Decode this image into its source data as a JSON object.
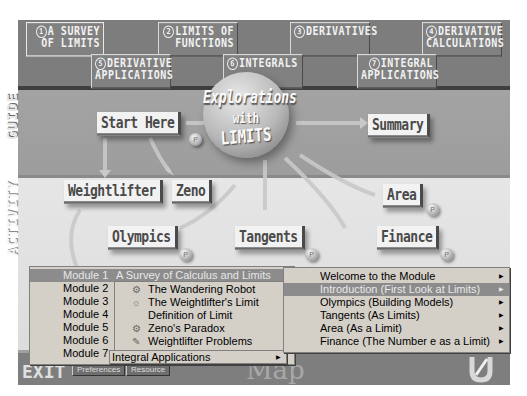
{
  "app_title": "Explorations with Limits",
  "module_tabs": [
    {
      "num": "1",
      "line1": "A SURVEY",
      "line2": "OF LIMITS",
      "active": true
    },
    {
      "num": "2",
      "line1": "LIMITS OF",
      "line2": "FUNCTIONS",
      "active": false
    },
    {
      "num": "3",
      "line1": "DERIVATIVES",
      "line2": "",
      "active": false
    },
    {
      "num": "4",
      "line1": "DERIVATIVE",
      "line2": "CALCULATIONS",
      "active": false
    },
    {
      "num": "5",
      "line1": "DERIVATIVE",
      "line2": "APPLICATIONS",
      "active": false
    },
    {
      "num": "6",
      "line1": "INTEGRALS",
      "line2": "",
      "active": false
    },
    {
      "num": "7",
      "line1": "INTEGRAL",
      "line2": "APPLICATIONS",
      "active": false
    }
  ],
  "sections": {
    "guide": "GUIDE",
    "activity": "ACTIVITY"
  },
  "center_sphere": {
    "line1": "Explorations",
    "line2": "with",
    "line3": "LIMITS"
  },
  "guide_nodes": {
    "start": "Start Here",
    "summary": "Summary"
  },
  "activity_nodes": {
    "weightlifter": "Weightlifter",
    "zeno": "Zeno",
    "olympics": "Olympics",
    "tangents": "Tangents",
    "area": "Area",
    "finance": "Finance"
  },
  "bubble_label": "P",
  "bottom_bar": {
    "exit": "EXIT",
    "preferences": "Preferences",
    "resource": "Resource",
    "map": "Map"
  },
  "module_menu": {
    "items": [
      {
        "label": "Module 1",
        "sub": "A Survey of Calculus and Limits",
        "highlighted": true
      },
      {
        "label": "Module 2"
      },
      {
        "label": "Module 3"
      },
      {
        "label": "Module 4"
      },
      {
        "label": "Module 5"
      },
      {
        "label": "Module 6"
      },
      {
        "label": "Module 7"
      }
    ]
  },
  "module1_submenu": {
    "items": [
      {
        "icon": "robot-icon",
        "glyph": "⚙",
        "label": "The Wandering Robot"
      },
      {
        "icon": "weightlifter-icon",
        "glyph": "☼",
        "label": "The Weightlifter's Limit"
      },
      {
        "icon": "",
        "glyph": "",
        "label": "Definition of Limit"
      },
      {
        "icon": "robot-icon",
        "glyph": "⚙",
        "label": "Zeno's Paradox"
      },
      {
        "icon": "pencil-pad-icon",
        "glyph": "✎",
        "label": "Weightlifter Problems"
      }
    ]
  },
  "module7_submenu": {
    "label": "Integral Applications"
  },
  "topics_menu": {
    "items": [
      {
        "label": "Welcome to the Module",
        "highlighted": false
      },
      {
        "label": "Introduction (First Look at Limits)",
        "highlighted": true
      },
      {
        "label": "Olympics (Building Models)",
        "highlighted": false
      },
      {
        "label": "Tangents (As Limits)",
        "highlighted": false
      },
      {
        "label": "Area (As a Limit)",
        "highlighted": false
      },
      {
        "label": "Finance (The Number e as a Limit)",
        "highlighted": false
      }
    ]
  },
  "submenu_arrow": "▶"
}
